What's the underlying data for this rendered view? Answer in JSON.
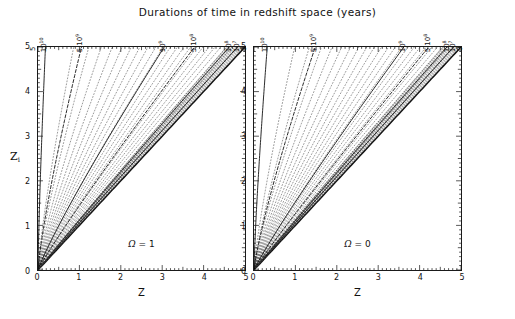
{
  "figure": {
    "title": "Durations of time in redshift space (years)",
    "xlabel": "Z",
    "ylabel_main": "Z",
    "ylabel_sub": "i"
  },
  "panels": [
    {
      "id": "left",
      "annotation": "Ω = 1",
      "omega_symbol": "Ω",
      "omega_value": "= 1"
    },
    {
      "id": "right",
      "annotation": "Ω = 0",
      "omega_symbol": "Ω",
      "omega_value": "= 0"
    }
  ],
  "axis": {
    "x_ticks": [
      "0",
      "1",
      "2",
      "3",
      "4",
      "5"
    ],
    "y_ticks": [
      "0",
      "1",
      "2",
      "3",
      "4",
      "5"
    ],
    "x_min": 0,
    "x_max": 5,
    "y_min": 0,
    "y_max": 5
  },
  "top_axis": {
    "left_panel_labels": [
      {
        "text_html": "5",
        "x": -0.08
      },
      {
        "text_html": "10<sup>10</sup>",
        "x": 0.18
      },
      {
        "text_html": "5·10<sup>9</sup>",
        "x": 1.05
      },
      {
        "text_html": "10<sup>9</sup>",
        "x": 3.05
      },
      {
        "text_html": "5·10<sup>8</sup>",
        "x": 3.78
      },
      {
        "text_html": "10<sup>8</sup>",
        "x": 4.62
      },
      {
        "text_html": "10<sup>7</sup>",
        "x": 4.82
      },
      {
        "text_html": "0",
        "x": 4.98
      }
    ],
    "right_panel_labels": [
      {
        "text_html": "10<sup>10</sup>",
        "x": 0.32
      },
      {
        "text_html": "5·10<sup>9</sup>",
        "x": 1.48
      },
      {
        "text_html": "10<sup>9</sup>",
        "x": 3.62
      },
      {
        "text_html": "5·10<sup>8</sup>",
        "x": 4.22
      },
      {
        "text_html": "10<sup>8</sup>",
        "x": 4.66
      },
      {
        "text_html": "10<sup>7</sup>",
        "x": 4.82
      },
      {
        "text_html": "0",
        "x": 4.97
      }
    ]
  },
  "chart_data": {
    "type": "line",
    "title": "Durations of time in redshift space (years)",
    "xlabel": "Z",
    "ylabel": "Z_i",
    "xlim": [
      0,
      5
    ],
    "ylim": [
      0,
      5
    ],
    "grid": false,
    "legend": null,
    "panels": [
      {
        "name": "Ω = 1",
        "series": [
          {
            "name": "10^10 yr",
            "style": "solid",
            "slope_at_top": 0.18,
            "values": [
              [
                0,
                0
              ],
              [
                0.05,
                1.4
              ],
              [
                0.09,
                2.8
              ],
              [
                0.14,
                4.2
              ],
              [
                0.18,
                5.0
              ]
            ]
          },
          {
            "name": "5x10^9 yr",
            "style": "dashed",
            "slope_at_top": 1.05,
            "values": [
              [
                0,
                0
              ],
              [
                0.3,
                1.4
              ],
              [
                0.58,
                2.8
              ],
              [
                0.88,
                4.2
              ],
              [
                1.05,
                5.0
              ]
            ]
          },
          {
            "name": "10^9 yr",
            "style": "solid",
            "slope_at_top": 3.05,
            "values": [
              [
                0,
                0
              ],
              [
                0.62,
                1.4
              ],
              [
                1.4,
                2.8
              ],
              [
                2.36,
                4.2
              ],
              [
                3.05,
                5.0
              ]
            ]
          },
          {
            "name": "5x10^8 yr",
            "style": "dashed",
            "slope_at_top": 3.78,
            "values": [
              [
                0,
                0
              ],
              [
                0.88,
                1.4
              ],
              [
                1.88,
                2.8
              ],
              [
                3.0,
                4.2
              ],
              [
                3.78,
                5.0
              ]
            ]
          },
          {
            "name": "10^8 yr",
            "style": "solid",
            "slope_at_top": 4.62,
            "values": [
              [
                0,
                0
              ],
              [
                1.22,
                1.4
              ],
              [
                2.49,
                2.8
              ],
              [
                3.82,
                4.2
              ],
              [
                4.62,
                5.0
              ]
            ]
          },
          {
            "name": "10^7 yr",
            "style": "solid",
            "slope_at_top": 4.82,
            "values": [
              [
                0,
                0
              ],
              [
                1.31,
                1.4
              ],
              [
                2.64,
                2.8
              ],
              [
                4.0,
                4.2
              ],
              [
                4.82,
                5.0
              ]
            ]
          },
          {
            "name": "0 yr (Z_i = Z)",
            "style": "heavy-solid",
            "slope_at_top": 5.0,
            "values": [
              [
                0,
                0
              ],
              [
                1.4,
                1.4
              ],
              [
                2.8,
                2.8
              ],
              [
                4.2,
                4.2
              ],
              [
                5,
                5
              ]
            ]
          }
        ],
        "dotted_isochrone_count": 22
      },
      {
        "name": "Ω = 0",
        "series": [
          {
            "name": "10^10 yr",
            "style": "solid",
            "slope_at_top": 0.32,
            "values": [
              [
                0,
                0
              ],
              [
                0.09,
                1.4
              ],
              [
                0.17,
                2.8
              ],
              [
                0.26,
                4.2
              ],
              [
                0.32,
                5.0
              ]
            ]
          },
          {
            "name": "5x10^9 yr",
            "style": "dashed",
            "slope_at_top": 1.48,
            "values": [
              [
                0,
                0
              ],
              [
                0.42,
                1.4
              ],
              [
                0.82,
                2.8
              ],
              [
                1.24,
                4.2
              ],
              [
                1.48,
                5.0
              ]
            ]
          },
          {
            "name": "10^9 yr",
            "style": "solid",
            "slope_at_top": 3.62,
            "values": [
              [
                0,
                0
              ],
              [
                0.8,
                1.4
              ],
              [
                1.78,
                2.8
              ],
              [
                2.88,
                4.2
              ],
              [
                3.62,
                5.0
              ]
            ]
          },
          {
            "name": "5x10^8 yr",
            "style": "dashed",
            "slope_at_top": 4.22,
            "values": [
              [
                0,
                0
              ],
              [
                1.02,
                1.4
              ],
              [
                2.18,
                2.8
              ],
              [
                3.42,
                4.2
              ],
              [
                4.22,
                5.0
              ]
            ]
          },
          {
            "name": "10^8 yr",
            "style": "solid",
            "slope_at_top": 4.66,
            "values": [
              [
                0,
                0
              ],
              [
                1.24,
                1.4
              ],
              [
                2.52,
                2.8
              ],
              [
                3.86,
                4.2
              ],
              [
                4.66,
                5.0
              ]
            ]
          },
          {
            "name": "10^7 yr",
            "style": "solid",
            "slope_at_top": 4.82,
            "values": [
              [
                0,
                0
              ],
              [
                1.31,
                1.4
              ],
              [
                2.64,
                2.8
              ],
              [
                4.0,
                4.2
              ],
              [
                4.82,
                5.0
              ]
            ]
          },
          {
            "name": "0 yr (Z_i = Z)",
            "style": "heavy-solid",
            "slope_at_top": 5.0,
            "values": [
              [
                0,
                0
              ],
              [
                1.4,
                1.4
              ],
              [
                2.8,
                2.8
              ],
              [
                4.2,
                4.2
              ],
              [
                5,
                5
              ]
            ]
          }
        ],
        "dotted_isochrone_count": 22
      }
    ]
  }
}
